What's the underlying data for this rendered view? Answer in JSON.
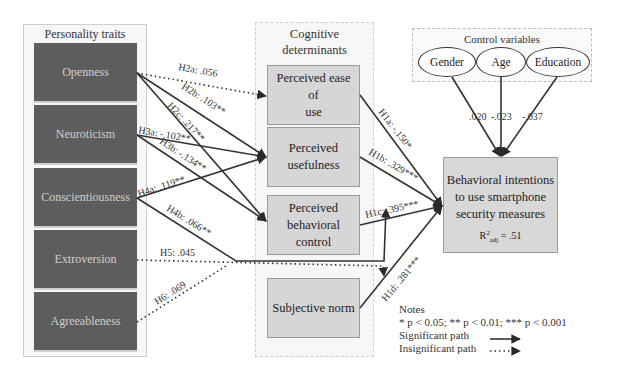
{
  "personality": {
    "title": "Personality traits",
    "traits": [
      "Openness",
      "Neuroticism",
      "Conscientiousness",
      "Extroversion",
      "Agreeableness"
    ]
  },
  "cognitive": {
    "title_line1": "Cognitive",
    "title_line2": "determinants",
    "items": [
      {
        "line1": "Perceived ease of",
        "line2": "use"
      },
      {
        "line1": "Perceived",
        "line2": "usefulness"
      },
      {
        "line1": "Perceived",
        "line2": "behavioral",
        "line3": "control"
      },
      {
        "line1": "Subjective norm"
      }
    ]
  },
  "control": {
    "title": "Control variables",
    "variables": [
      "Gender",
      "Age",
      "Education"
    ],
    "coefficients": [
      ".020",
      "-.023",
      "-.037"
    ]
  },
  "outcome": {
    "line1": "Behavioral intentions",
    "line2": "to use smartphone",
    "line3": "security measures",
    "r2_prefix": "R",
    "r2_sup": "2",
    "r2_sub": "adj",
    "r2_value": " = .51"
  },
  "paths": {
    "H2a": "H2a: .056",
    "H2b": "H2b: .103**",
    "H2c": "H2c: .217**",
    "H3a": "H3a: -.102**",
    "H3b": "H3b: -.134**",
    "H4a": "H4a: .119**",
    "H4b": "H4b: .066**",
    "H5": "H5: .045",
    "H6": "H6: .069",
    "H1a": "H1a: -.150*",
    "H1b": "H1b: .329***",
    "H1c": "H1c: .395***",
    "H1d": "H1d: .281***"
  },
  "notes": {
    "title": "Notes",
    "significance": "* p < 0.05; ** p < 0.01; *** p < 0.001",
    "significant": "Significant path",
    "insignificant": "Insignificant path"
  },
  "colors": {
    "trait_fill": "#5d5d5d",
    "box_fill": "#d6d6d6",
    "line": "#333333"
  }
}
